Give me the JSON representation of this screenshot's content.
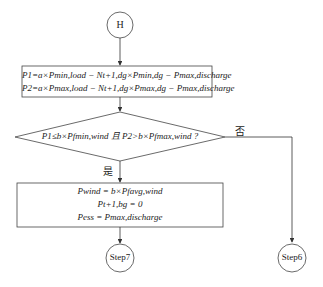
{
  "diagram": {
    "start_node": {
      "label": "H"
    },
    "process1": {
      "lines": [
        {
          "lhs": "P",
          "lhs_sub": "1",
          "expr": [
            "=a×",
            "P",
            "min, load",
            " − ",
            "N",
            "t+1, dg",
            "×",
            "P",
            "min, dg",
            " − ",
            "P",
            "max, discharge"
          ]
        },
        {
          "lhs": "P",
          "lhs_sub": "2",
          "expr": [
            "=a×",
            "P",
            "max, load",
            " − ",
            "N",
            "t+1, dg",
            "×",
            "P",
            "max, dg",
            " − ",
            "P",
            "max, discharge"
          ]
        }
      ],
      "line1_text": "P1=a×Pmin,load − Nt+1,dg×Pmin,dg − Pmax,discharge",
      "line2_text": "P2=a×Pmax,load − Nt+1,dg×Pmax,dg − Pmax,discharge"
    },
    "decision": {
      "text": "P1≤b×Pfmin,wind 且 P2>b×Pfmax,wind ?",
      "yes_label": "是",
      "no_label": "否"
    },
    "process2": {
      "line1_text": "Pwind = b×Pfavg,wind",
      "line2_text": "Pt+1,bg = 0",
      "line3_text": "Pess = Pmax,discharge"
    },
    "end_nodes": [
      {
        "label": "Step7"
      },
      {
        "label": "Step6"
      }
    ]
  }
}
